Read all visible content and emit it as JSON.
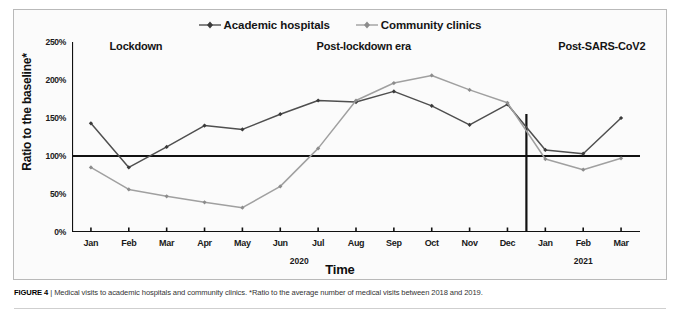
{
  "figure": {
    "caption_label": "FIGURE 4",
    "caption_sep": "|",
    "caption_text": "Medical visits to academic hospitals and community clinics. *Ratio to the average number of medical visits between 2018 and 2019."
  },
  "legend": {
    "items": [
      {
        "label": "Academic hospitals",
        "color": "#4f4f4f",
        "marker": "diamond"
      },
      {
        "label": "Community clinics",
        "color": "#a0a0a0",
        "marker": "diamond"
      }
    ]
  },
  "periods": [
    {
      "label": "Lockdown",
      "left_pct": 19.5
    },
    {
      "label": "Post-lockdown era",
      "left_pct": 53.5
    },
    {
      "label": "Post-SARS-CoV2",
      "left_pct": 88.5
    }
  ],
  "axes": {
    "ylabel": "Ratio to the baseline*",
    "xlabel": "Time",
    "yticks": [
      "250%",
      "200%",
      "150%",
      "100%",
      "50%",
      "0%"
    ],
    "ymin": 0,
    "ymax": 250,
    "baseline": 100,
    "year_groups": [
      {
        "label": "2020",
        "center_index": 6
      },
      {
        "label": "2021",
        "center_index": 13
      }
    ],
    "divider_after_index": 11
  },
  "chart_data": {
    "type": "line",
    "title": "Medical visits to academic hospitals and community clinics",
    "xlabel": "Time",
    "ylabel": "Ratio to the baseline*",
    "ylim": [
      0,
      250
    ],
    "ytick_values": [
      0,
      50,
      100,
      150,
      200,
      250
    ],
    "ytick_labels": [
      "0%",
      "50%",
      "100%",
      "150%",
      "200%",
      "250%"
    ],
    "grid": false,
    "legend_position": "top-center",
    "categories": [
      "Jan",
      "Feb",
      "Mar",
      "Apr",
      "May",
      "Jun",
      "Jul",
      "Aug",
      "Sep",
      "Oct",
      "Nov",
      "Dec",
      "Jan",
      "Feb",
      "Mar"
    ],
    "year_spans": [
      {
        "year": "2020",
        "from": 0,
        "to": 11
      },
      {
        "year": "2021",
        "from": 12,
        "to": 14
      }
    ],
    "annotations": [
      {
        "text": "Lockdown",
        "span": [
          0,
          4
        ]
      },
      {
        "text": "Post-lockdown era",
        "span": [
          5,
          11
        ]
      },
      {
        "text": "Post-SARS-CoV2",
        "span": [
          12,
          14
        ]
      }
    ],
    "reference_line": {
      "value": 100,
      "label": "baseline (100%)"
    },
    "series": [
      {
        "name": "Academic hospitals",
        "color": "#4f4f4f",
        "values": [
          143,
          85,
          112,
          140,
          135,
          155,
          173,
          171,
          185,
          166,
          141,
          168,
          108,
          103,
          150
        ]
      },
      {
        "name": "Community clinics",
        "color": "#a0a0a0",
        "values": [
          85,
          56,
          47,
          39,
          32,
          60,
          110,
          173,
          196,
          206,
          187,
          170,
          96,
          82,
          97
        ]
      }
    ]
  }
}
